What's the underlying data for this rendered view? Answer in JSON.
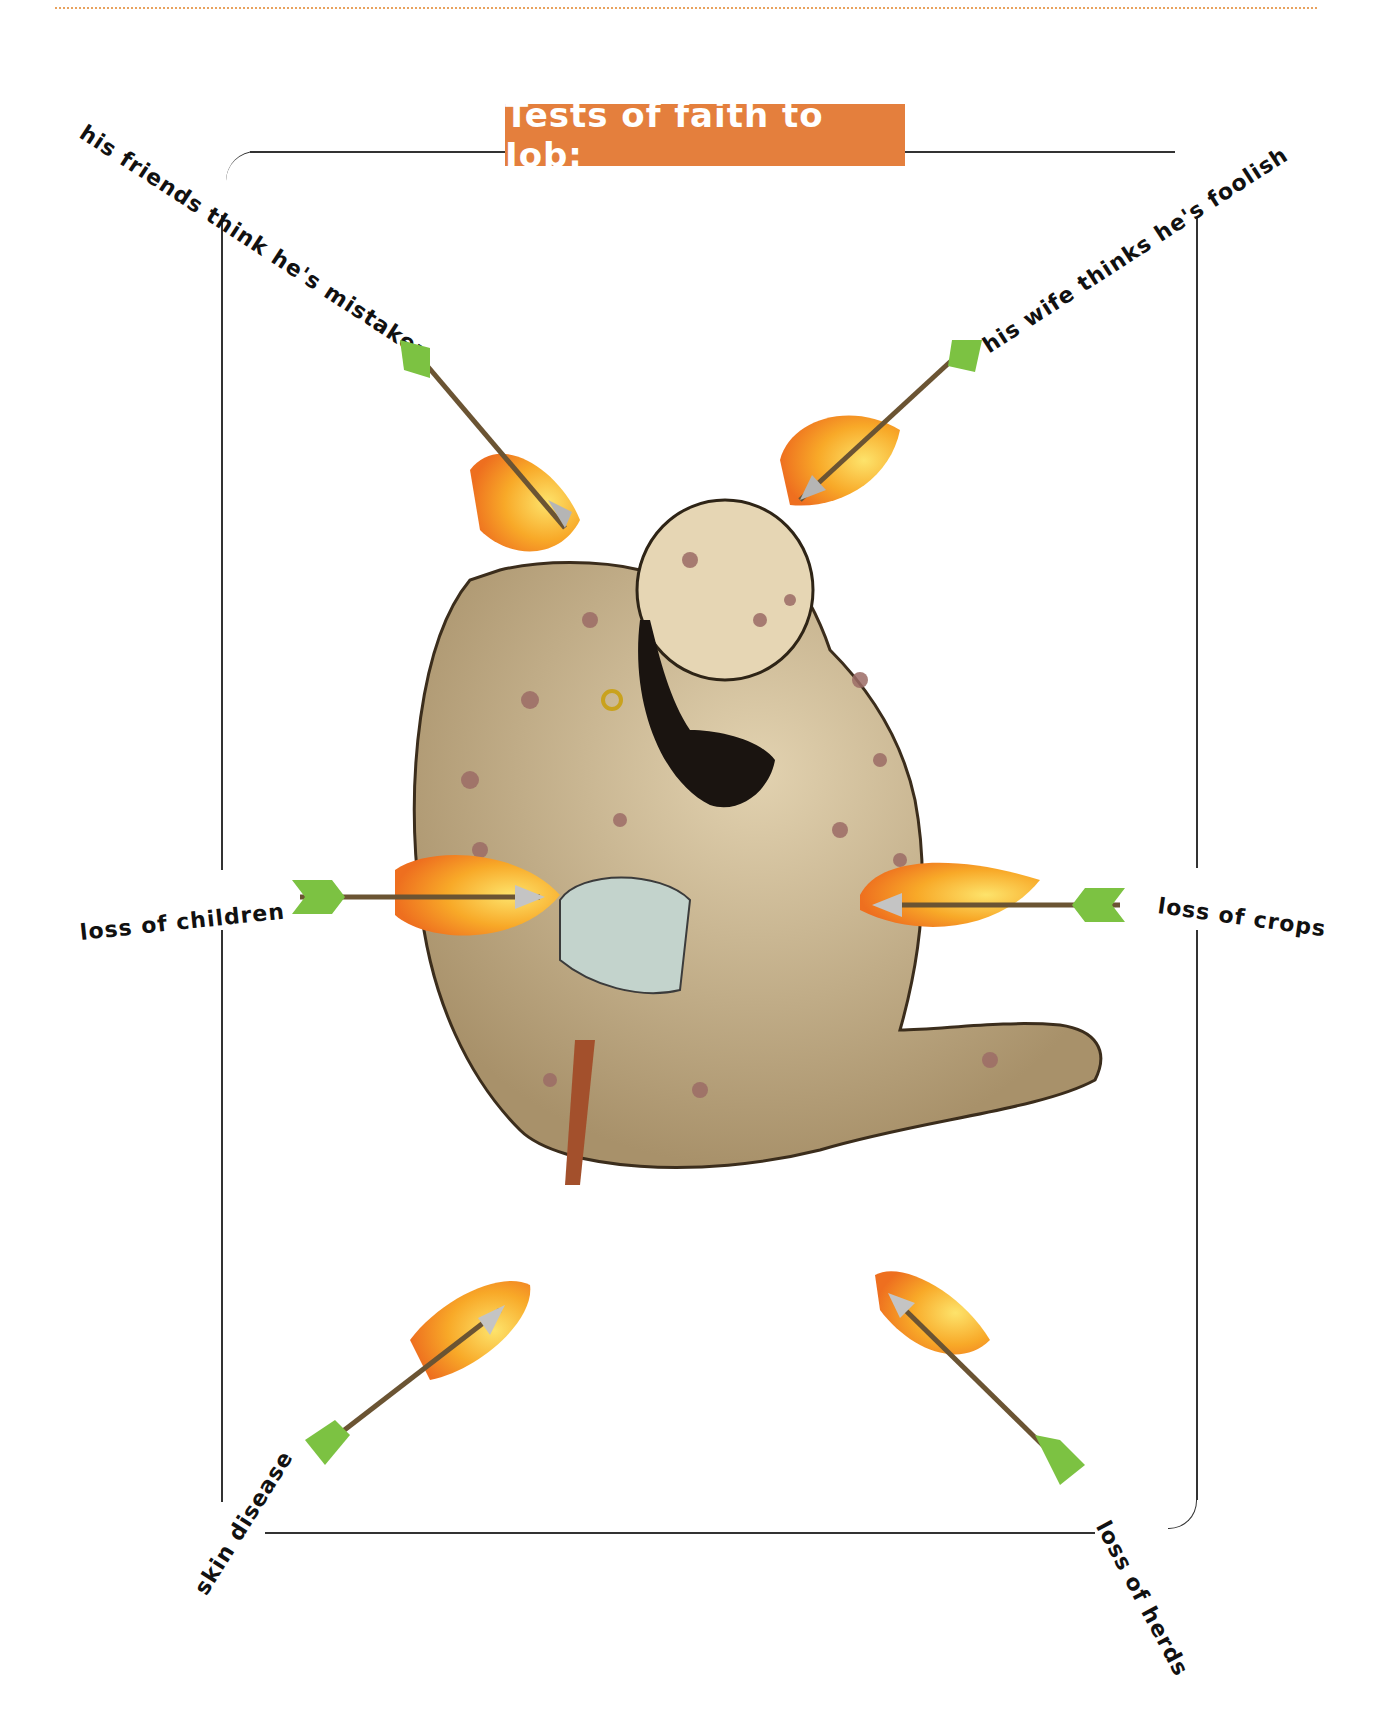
{
  "header": {
    "title": "Tests of faith to Job:",
    "title_bg_color": "#e47f3d",
    "rule_color": "#e8a25e"
  },
  "tests": [
    {
      "label": "his friends think he's mistaken",
      "position": "top-left"
    },
    {
      "label": "his wife thinks he's foolish",
      "position": "top-right"
    },
    {
      "label": "loss of children",
      "position": "middle-left"
    },
    {
      "label": "loss of crops",
      "position": "middle-right"
    },
    {
      "label": "skin disease",
      "position": "bottom-left"
    },
    {
      "label": "loss of herds",
      "position": "bottom-right"
    }
  ],
  "illustration": {
    "subject": "Job seated, covered in sores, holding a potsherd",
    "arrow_fletching_color": "#7cc242",
    "flame_colors": [
      "#f7a51c",
      "#fcd23a",
      "#f07b23"
    ],
    "skin_color": "#c9b38c"
  }
}
